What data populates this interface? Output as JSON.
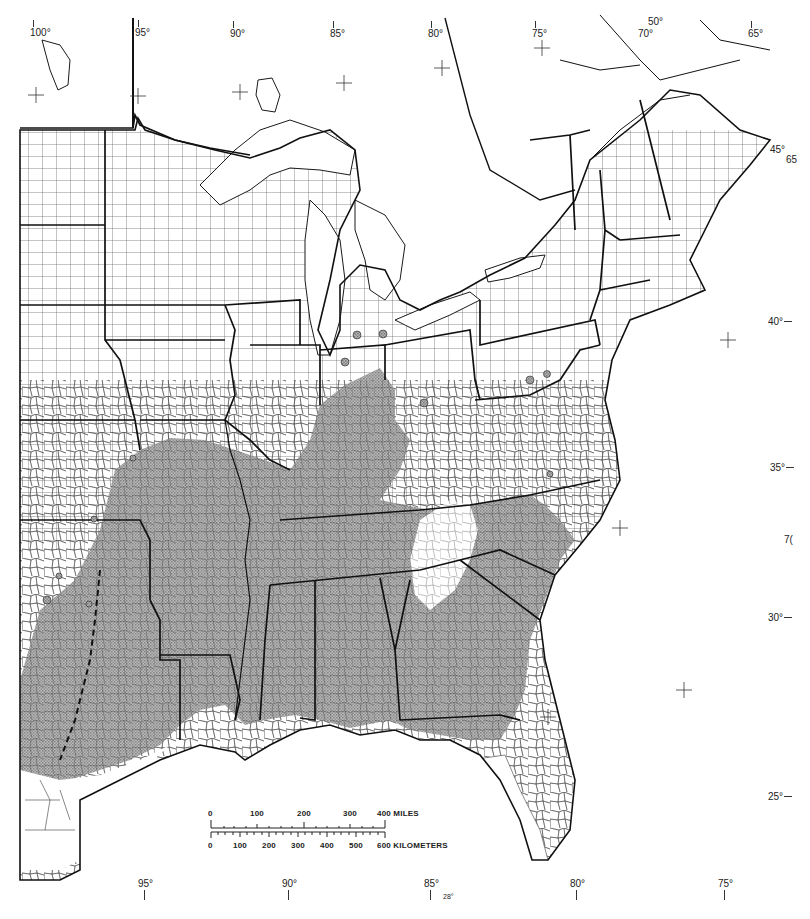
{
  "map": {
    "title": "Eastern United States county map with shaded distribution region",
    "shade_color": "#9a9a9a",
    "border_color": "#1a1a1a",
    "background": "#ffffff"
  },
  "graticule": {
    "top_longitudes": [
      {
        "label": "100°",
        "x": 30,
        "y": 28
      },
      {
        "label": "95°",
        "x": 135,
        "y": 28
      },
      {
        "label": "90°",
        "x": 230,
        "y": 29
      },
      {
        "label": "85°",
        "x": 330,
        "y": 29
      },
      {
        "label": "80°",
        "x": 428,
        "y": 29
      },
      {
        "label": "75°",
        "x": 532,
        "y": 29
      },
      {
        "label": "70°",
        "x": 638,
        "y": 29
      },
      {
        "label": "65°",
        "x": 748,
        "y": 29
      }
    ],
    "top_extra": [
      {
        "label": "50°",
        "x": 648,
        "y": 17
      }
    ],
    "right_latitudes": [
      {
        "label": "45°",
        "x": 770,
        "y": 145
      },
      {
        "label": "40°",
        "x": 768,
        "y": 317
      },
      {
        "label": "35°",
        "x": 770,
        "y": 463
      },
      {
        "label": "30°",
        "x": 768,
        "y": 613
      },
      {
        "label": "25°",
        "x": 768,
        "y": 792
      }
    ],
    "right_extra": [
      {
        "label": "65",
        "x": 786,
        "y": 155
      },
      {
        "label": "7(",
        "x": 784,
        "y": 535
      }
    ],
    "bottom_longitudes": [
      {
        "label": "95°",
        "x": 138,
        "y": 879
      },
      {
        "label": "90°",
        "x": 282,
        "y": 879
      },
      {
        "label": "85°",
        "x": 424,
        "y": 879
      },
      {
        "label": "80°",
        "x": 570,
        "y": 879
      },
      {
        "label": "75°",
        "x": 718,
        "y": 879
      }
    ],
    "bottom_extra": [
      {
        "label": "28°",
        "x": 443,
        "y": 893
      }
    ]
  },
  "scale": {
    "miles_label": "400 MILES",
    "km_label": "600 KILOMETERS",
    "miles_ticks": [
      "0",
      "100",
      "200",
      "300"
    ],
    "km_ticks": [
      "0",
      "100",
      "200",
      "300",
      "400",
      "500"
    ]
  }
}
